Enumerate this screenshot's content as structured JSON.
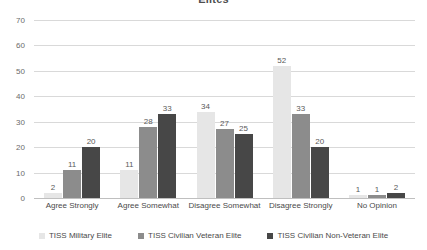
{
  "chart_data": {
    "type": "bar",
    "title": "Elites",
    "xlabel": "",
    "ylabel": "",
    "ylim": [
      0,
      70
    ],
    "ytick_step": 10,
    "yticks": [
      70,
      60,
      50,
      40,
      30,
      20,
      10,
      0
    ],
    "grid": true,
    "legend_position": "bottom",
    "categories": [
      "Agree Strongly",
      "Agree Somewhat",
      "Disagree Somewhat",
      "Disagree Strongly",
      "No Opinion"
    ],
    "series": [
      {
        "name": "TISS Military Elite",
        "color": "#e6e6e6",
        "values": [
          2,
          11,
          34,
          52,
          1
        ]
      },
      {
        "name": "TISS Civilian Veteran Elite",
        "color": "#8c8c8c",
        "values": [
          11,
          28,
          27,
          33,
          1
        ]
      },
      {
        "name": "TISS Civilian Non-Veteran Elite",
        "color": "#474747",
        "values": [
          20,
          33,
          25,
          20,
          2
        ]
      }
    ]
  }
}
